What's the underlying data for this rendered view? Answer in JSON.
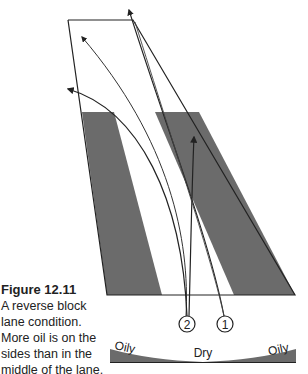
{
  "figure": {
    "label": "Figure 12.11",
    "caption_lines": [
      "A reverse block",
      "lane condition.",
      "More oil is on the",
      "sides than in the",
      "middle of the lane."
    ]
  },
  "diagram": {
    "type": "bowling lane oil pattern",
    "stripe_color": "#6b6b6b",
    "line_color": "#222222",
    "markers": [
      {
        "id": "1",
        "label": "1"
      },
      {
        "id": "2",
        "label": "2"
      }
    ],
    "oil_profile": {
      "left_label": "Oily",
      "center_label": "Dry",
      "right_label": "Oily"
    }
  }
}
